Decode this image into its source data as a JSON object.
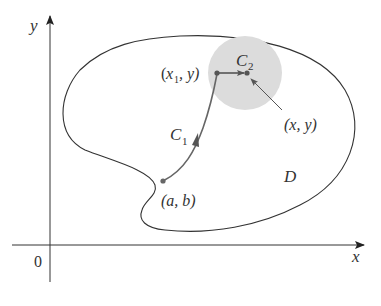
{
  "diagram": {
    "axes": {
      "x_label": "x",
      "y_label": "y",
      "origin_label": "0"
    },
    "region": {
      "label": "D"
    },
    "curves": [
      {
        "name": "C1",
        "label_main": "C",
        "label_sub": "1"
      },
      {
        "name": "C2",
        "label_main": "C",
        "label_sub": "2"
      }
    ],
    "points": {
      "start": "(a, b)",
      "x1y_open": "(",
      "x1y_x": "x",
      "x1y_sub": "1",
      "x1y_rest": ", y)",
      "end": "(x, y)"
    },
    "colors": {
      "stroke": "#333333",
      "curve": "#666666",
      "disk": "#dcdcdc",
      "point": "#555555"
    }
  }
}
